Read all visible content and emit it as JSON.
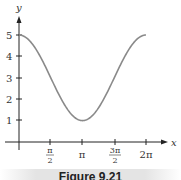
{
  "chart_data": {
    "type": "line",
    "title": "",
    "caption": "Figure 9.21",
    "xlabel": "x",
    "ylabel": "y",
    "function": "y = 3 + 2cos(x)",
    "xlim": [
      0,
      6.2832
    ],
    "ylim": [
      0,
      5.5
    ],
    "x_ticks": [
      {
        "value": 1.5708,
        "label_num": "π",
        "label_den": "2"
      },
      {
        "value": 3.1416,
        "label": "π"
      },
      {
        "value": 4.7124,
        "label_num": "3π",
        "label_den": "2"
      },
      {
        "value": 6.2832,
        "label": "2π"
      }
    ],
    "y_ticks": [
      1,
      2,
      3,
      4,
      5
    ],
    "series": [
      {
        "name": "curve",
        "x": [
          0,
          0.7854,
          1.5708,
          2.3562,
          3.1416,
          3.927,
          4.7124,
          5.4978,
          6.2832
        ],
        "values": [
          5,
          4.41,
          3,
          1.59,
          1,
          1.59,
          3,
          4.41,
          5
        ]
      }
    ],
    "grid": false,
    "legend": null
  },
  "labels": {
    "x_axis": "x",
    "y_axis": "y",
    "y1": "1",
    "y2": "2",
    "y3": "3",
    "y4": "4",
    "y5": "5",
    "xt1_num": "π",
    "xt1_den": "2",
    "xt2": "π",
    "xt3_num": "3π",
    "xt3_den": "2",
    "xt4": "2π",
    "caption": "Figure 9.21"
  },
  "colors": {
    "curve": "#8a8a8a",
    "axis": "#222222",
    "caption_band": "#e4e4e4"
  }
}
